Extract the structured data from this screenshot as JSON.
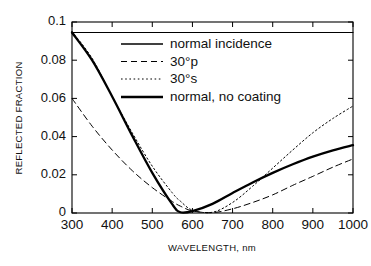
{
  "chart_data": {
    "type": "line",
    "title": "",
    "xlabel": "WAVELENGTH, nm",
    "ylabel": "REFLECTED FRACTION",
    "xlim": [
      300,
      1000
    ],
    "ylim": [
      0,
      0.1
    ],
    "xticks": [
      300,
      400,
      500,
      600,
      700,
      800,
      900,
      1000
    ],
    "xtick_labels": [
      "300",
      "400",
      "500",
      "600",
      "700",
      "800",
      "900",
      "1000"
    ],
    "yticks": [
      0,
      0.02,
      0.04,
      0.06,
      0.08,
      0.1
    ],
    "ytick_labels": [
      "0",
      "0.02",
      "0.04",
      "0.06",
      "0.08",
      "0.1"
    ],
    "grid": false,
    "legend_position": "upper center inside",
    "x": [
      300,
      350,
      400,
      450,
      500,
      550,
      570,
      600,
      650,
      700,
      750,
      800,
      850,
      900,
      950,
      1000
    ],
    "series": [
      {
        "name": "normal  incidence",
        "style": "solid-thin",
        "linewidth": 1.1,
        "color": "#000000",
        "values": [
          0.0945,
          0.0945,
          0.0945,
          0.0945,
          0.0945,
          0.0945,
          0.0945,
          0.0945,
          0.0945,
          0.0945,
          0.0945,
          0.0945,
          0.0945,
          0.0945,
          0.0945,
          0.0945
        ]
      },
      {
        "name": "30°p",
        "style": "dashed",
        "linewidth": 1.0,
        "color": "#000000",
        "values": [
          0.06,
          0.0455,
          0.033,
          0.0222,
          0.0133,
          0.006,
          0.0036,
          0.0011,
          0.0002,
          0.0022,
          0.0055,
          0.0095,
          0.0145,
          0.0192,
          0.024,
          0.0283
        ]
      },
      {
        "name": "30°s",
        "style": "dotted",
        "linewidth": 1.0,
        "color": "#000000",
        "values": [
          0.095,
          0.081,
          0.061,
          0.042,
          0.0245,
          0.0105,
          0.0062,
          0.0015,
          0.0004,
          0.0055,
          0.014,
          0.0235,
          0.033,
          0.042,
          0.0495,
          0.056
        ]
      },
      {
        "name": "normal,  no  coating",
        "style": "solid-thick",
        "linewidth": 2.3,
        "color": "#000000",
        "values": [
          0.0945,
          0.08,
          0.061,
          0.0405,
          0.021,
          0.0045,
          0.0004,
          0.001,
          0.0048,
          0.0105,
          0.016,
          0.021,
          0.0255,
          0.0295,
          0.0328,
          0.0355
        ]
      }
    ],
    "legend_entries": [
      {
        "label": "normal  incidence",
        "style": "solid-thin"
      },
      {
        "label": "30°p",
        "style": "dashed"
      },
      {
        "label": "30°s",
        "style": "dotted"
      },
      {
        "label": "normal,  no  coating",
        "style": "solid-thick"
      }
    ]
  }
}
